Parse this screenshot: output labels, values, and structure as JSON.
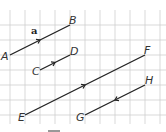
{
  "grid": {
    "spacing": 15,
    "x0": 10,
    "y0": 10,
    "color": "#cfcfcf"
  },
  "vectors": [
    {
      "name": "AB",
      "from": "A",
      "to": "B",
      "x1": 10,
      "y1": 55,
      "x2": 70,
      "y2": 25,
      "arrow_dir": "forward",
      "label": "a"
    },
    {
      "name": "CD",
      "from": "C",
      "to": "D",
      "x1": 40,
      "y1": 70,
      "x2": 70,
      "y2": 55,
      "arrow_dir": "forward"
    },
    {
      "name": "EF",
      "from": "E",
      "to": "F",
      "x1": 25,
      "y1": 115,
      "x2": 145,
      "y2": 55,
      "arrow_dir": "forward"
    },
    {
      "name": "GH",
      "from": "G",
      "to": "H",
      "x1": 85,
      "y1": 115,
      "x2": 145,
      "y2": 85,
      "arrow_dir": "backward"
    }
  ],
  "labels": {
    "A": "A",
    "B": "B",
    "C": "C",
    "D": "D",
    "E": "E",
    "F": "F",
    "G": "G",
    "H": "H",
    "a": "a"
  },
  "line_color": "#222222"
}
